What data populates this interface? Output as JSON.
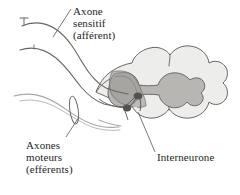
{
  "figure": {
    "background_color": "#ffffff",
    "width": 240,
    "height": 195
  },
  "labels": {
    "sensory_axon": {
      "line1": "Axone",
      "line2": "sensitif",
      "line3": "(afférent)"
    },
    "motor_axons": {
      "line1": "Axones",
      "line2": "moteurs",
      "line3": "(efférents)"
    },
    "interneuron": {
      "line1": "Interneurone"
    }
  },
  "colors": {
    "background": "#ffffff",
    "text": "#231f1e",
    "outline": "#5b5550",
    "white_matter_fill": "#ededec",
    "gray_matter_fill": "#b8b6b3",
    "highlight_overlay": "#9d9b98",
    "neuron_soma": "#55514e",
    "axon_stroke": "#6b6561",
    "motor_axon_stroke": "#a9a5a1",
    "leader_line": "#6e6864"
  },
  "structures": {
    "spinal_cord": "spinal-cord-cross-section",
    "white_matter": "white-matter",
    "gray_matter": "gray-matter-butterfly",
    "dorsal_horn_highlight": "dorsal-horn-highlight",
    "neuron_somas": [
      "sensory-soma",
      "interneuron-soma"
    ],
    "receptor_endings": [
      "receptor-ending-upper",
      "receptor-ending-lower"
    ],
    "nerve_marker": "peripheral-nerve-marker"
  }
}
